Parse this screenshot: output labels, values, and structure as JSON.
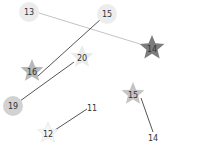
{
  "board": {
    "background": "#ffffff",
    "nodes": [
      {
        "id": "n13",
        "label": "13",
        "shape": "circle",
        "x": 29,
        "y": 12,
        "r": 10,
        "fill": "#ececec"
      },
      {
        "id": "n15a",
        "label": "15",
        "shape": "circle",
        "x": 107,
        "y": 14,
        "r": 10,
        "fill": "#ededed"
      },
      {
        "id": "n14a",
        "label": "14",
        "shape": "star",
        "x": 152,
        "y": 47,
        "r": 13,
        "fill": "#7c7c7c"
      },
      {
        "id": "n16",
        "label": "16",
        "shape": "star",
        "x": 32,
        "y": 70,
        "r": 12,
        "fill": "#b8b8b8"
      },
      {
        "id": "n20",
        "label": "20",
        "shape": "star",
        "x": 82,
        "y": 56,
        "r": 12,
        "fill": "#ebebeb"
      },
      {
        "id": "n19",
        "label": "19",
        "shape": "circle",
        "x": 13,
        "y": 106,
        "r": 10,
        "fill": "#d2d2d2"
      },
      {
        "id": "n11",
        "label": "11",
        "shape": "none",
        "x": 92,
        "y": 108
      },
      {
        "id": "n12",
        "label": "12",
        "shape": "star",
        "x": 48,
        "y": 132,
        "r": 11,
        "fill": "#f6f6f6"
      },
      {
        "id": "n15b",
        "label": "15",
        "shape": "star",
        "x": 133,
        "y": 93,
        "r": 12,
        "fill": "#c4c4c4"
      },
      {
        "id": "n14b",
        "label": "14",
        "shape": "none",
        "x": 153,
        "y": 138
      }
    ],
    "edges": [
      {
        "from": "n13",
        "to": "n14a",
        "x1": 39,
        "y1": 13,
        "x2": 140,
        "y2": 44,
        "color": "#9a9a9a",
        "width": 0.6
      },
      {
        "from": "n15a",
        "to": "n16",
        "x1": 101,
        "y1": 19,
        "x2": 38,
        "y2": 76,
        "color": "#555555",
        "width": 1
      },
      {
        "from": "n20",
        "to": "n19",
        "x1": 74,
        "y1": 62,
        "x2": 20,
        "y2": 101,
        "color": "#555555",
        "width": 1
      },
      {
        "from": "n11",
        "to": "n12",
        "x1": 87,
        "y1": 109,
        "x2": 55,
        "y2": 130,
        "color": "#555555",
        "width": 1
      },
      {
        "from": "n15b",
        "to": "n14b",
        "x1": 141,
        "y1": 98,
        "x2": 153,
        "y2": 132,
        "color": "#555555",
        "width": 1
      }
    ]
  }
}
